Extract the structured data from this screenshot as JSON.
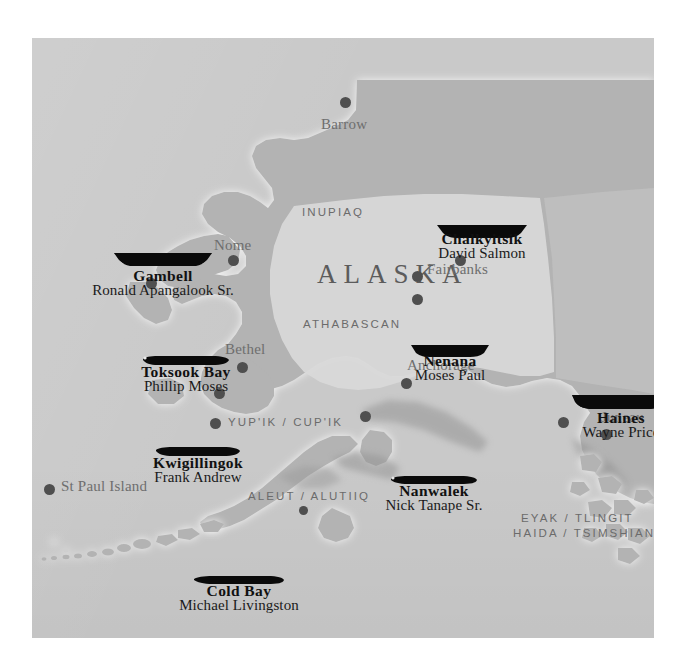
{
  "map": {
    "title": "ALASKA",
    "frame": {
      "x": 32,
      "y": 38,
      "width": 622,
      "height": 600
    },
    "colors": {
      "page_background": "#ffffff",
      "ocean": "#c9c9c9",
      "land": "#b3b3b3",
      "interior_region": "#d8d8d8",
      "coast_halo": "#f2f2f2",
      "boat_icon": "#0a0a0a",
      "city_dot": "#4f4f4f",
      "city_text": "#6e6e6e",
      "region_text": "#6b6b6b",
      "village_text": "#111111"
    },
    "culture_regions": [
      {
        "label": "INUPIAQ",
        "x": 302,
        "y": 173
      },
      {
        "label": "ATHABASCAN",
        "x": 303,
        "y": 285
      },
      {
        "label": "YUP'IK / CUP'IK",
        "x": 228,
        "y": 383
      },
      {
        "label": "ALEUT / ALUTIIQ",
        "x": 248,
        "y": 457
      },
      {
        "label": "EYAK / TLINGIT",
        "x": 521,
        "y": 479
      },
      {
        "label": "HAIDA / TSIMSHIAN",
        "x": 513,
        "y": 494
      }
    ],
    "cities": [
      {
        "name": "Barrow",
        "label_x": 321,
        "label_y": 117,
        "dot_x": 340,
        "dot_y": 97,
        "size": "lg"
      },
      {
        "name": "Nome",
        "label_x": 214,
        "label_y": 238,
        "dot_x": 228,
        "dot_y": 255,
        "size": "lg"
      },
      {
        "name": "Fairbanks",
        "label_x": 427,
        "label_y": 262,
        "dot_x": 412,
        "dot_y": 271,
        "size": "lg"
      },
      {
        "name": "Bethel",
        "label_x": 225,
        "label_y": 342,
        "dot_x": 237,
        "dot_y": 362,
        "size": "lg"
      },
      {
        "name": "Anchorage",
        "label_x": 407,
        "label_y": 358,
        "dot_x": 401,
        "dot_y": 378,
        "size": "lg"
      },
      {
        "name": "Juneau",
        "label_x": 601,
        "label_y": 410,
        "dot_x": 591,
        "dot_y": 429,
        "size": "lg"
      },
      {
        "name": "St Paul Island",
        "label_x": 61,
        "label_y": 479,
        "dot_x": 44,
        "dot_y": 484,
        "size": "lg"
      }
    ],
    "unlabeled_dots": [
      {
        "x": 455,
        "y": 255,
        "size": "lg"
      },
      {
        "x": 412,
        "y": 294,
        "size": "lg"
      },
      {
        "x": 214,
        "y": 388,
        "size": "lg"
      },
      {
        "x": 146,
        "y": 278,
        "size": "lg"
      },
      {
        "x": 360,
        "y": 411,
        "size": "lg"
      },
      {
        "x": 558,
        "y": 417,
        "size": "lg"
      },
      {
        "x": 299,
        "y": 506,
        "size": "sm"
      }
    ],
    "villages": [
      {
        "name": "Gambell",
        "person": "Ronald Apangalook Sr.",
        "label_x": 76,
        "label_y": 233,
        "boat_x": 80,
        "boat_y": 213,
        "boat_w": 102,
        "boat_type": "umiak"
      },
      {
        "name": "Chalkyitsik",
        "person": "David Salmon",
        "label_x": 401,
        "label_y": 197,
        "boat_x": 404,
        "boat_y": 186,
        "boat_w": 92,
        "boat_type": "canoe"
      },
      {
        "name": "Toksook Bay",
        "person": "Phillip Moses",
        "label_x": 100,
        "label_y": 329,
        "boat_x": 110,
        "boat_y": 316,
        "boat_w": 88,
        "boat_type": "kayak"
      },
      {
        "name": "Nenana",
        "person": "Moses Paul",
        "label_x": 377,
        "label_y": 318,
        "boat_x": 378,
        "boat_y": 306,
        "boat_w": 80,
        "boat_type": "canoe"
      },
      {
        "name": "Haines",
        "person": "Wayne Price",
        "label_x": 551,
        "label_y": 375,
        "boat_x": 539,
        "boat_y": 356,
        "boat_w": 100,
        "boat_type": "canoe"
      },
      {
        "name": "Kwigillingok",
        "person": "Frank Andrew",
        "label_x": 103,
        "label_y": 420,
        "boat_x": 123,
        "boat_y": 408,
        "boat_w": 86,
        "boat_type": "kayak"
      },
      {
        "name": "Nanwalek",
        "person": "Nick Tanape Sr.",
        "label_x": 356,
        "label_y": 448,
        "boat_x": 358,
        "boat_y": 436,
        "boat_w": 88,
        "boat_type": "kayak"
      },
      {
        "name": "Cold Bay",
        "person": "Michael Livingston",
        "label_x": 155,
        "label_y": 548,
        "boat_x": 161,
        "boat_y": 536,
        "boat_w": 92,
        "boat_type": "kayak"
      }
    ]
  }
}
